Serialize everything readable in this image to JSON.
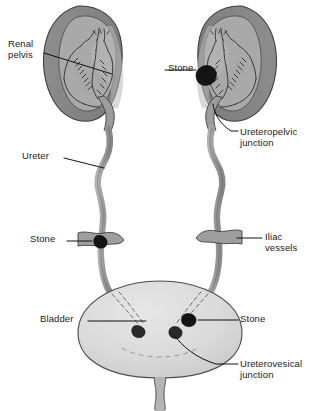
{
  "figure": {
    "type": "anatomical-diagram",
    "background_color": "#ffffff"
  },
  "colors": {
    "kidney_cortex": "#8a8a8a",
    "kidney_medulla": "#a8a8a8",
    "kidney_pelvis": "#9c9c9c",
    "ureter": "#9a9a9a",
    "bladder": "#d8d8d8",
    "stone": "#141414",
    "outline": "#3a3a3a",
    "leader_line": "#111111",
    "text": "#1a1a1a"
  },
  "labels": [
    {
      "id": "renal-pelvis",
      "line1": "Renal",
      "line2": "pelvis",
      "x": 8,
      "y": 38,
      "side": "left"
    },
    {
      "id": "stone-kidney",
      "line1": "Stone",
      "line2": "",
      "x": 168,
      "y": 66,
      "side": "left"
    },
    {
      "id": "ureteropelvic-junction",
      "line1": "Ureteropelvic",
      "line2": "junction",
      "x": 240,
      "y": 128,
      "side": "right"
    },
    {
      "id": "ureter",
      "line1": "Ureter",
      "line2": "",
      "x": 22,
      "y": 153,
      "side": "left"
    },
    {
      "id": "stone-ureter",
      "line1": "Stone",
      "line2": "",
      "x": 30,
      "y": 236,
      "side": "left"
    },
    {
      "id": "iliac-vessels",
      "line1": "Iliac",
      "line2": "vessels",
      "x": 265,
      "y": 234,
      "side": "right"
    },
    {
      "id": "bladder",
      "line1": "Bladder",
      "line2": "",
      "x": 40,
      "y": 316,
      "side": "left"
    },
    {
      "id": "stone-bladder",
      "line1": "Stone",
      "line2": "",
      "x": 240,
      "y": 316,
      "side": "right"
    },
    {
      "id": "ureterovesical-junction",
      "line1": "Ureterovesical",
      "line2": "junction",
      "x": 240,
      "y": 360,
      "side": "right"
    }
  ],
  "structures": {
    "left_kidney": "left-kidney-coronal-section",
    "right_kidney": "right-kidney-coronal-section",
    "left_ureter": "left-ureter",
    "right_ureter": "right-ureter",
    "bladder": "urinary-bladder",
    "urethra": "urethra",
    "iliac_vessel_left": "iliac-vessel-crossing-left",
    "iliac_vessel_right": "iliac-vessel-crossing-right"
  },
  "stones": [
    {
      "id": "stone-right-kidney-pelvis",
      "site": "renal pelvis / ureteropelvic junction",
      "cx": 207,
      "cy": 75,
      "rx": 9,
      "ry": 8
    },
    {
      "id": "stone-left-ureter-iliac",
      "site": "ureter at iliac vessel crossing",
      "cx": 101,
      "cy": 241,
      "rx": 5.5,
      "ry": 5
    },
    {
      "id": "stone-bladder-right-uvj",
      "site": "ureterovesical junction (right)",
      "cx": 190,
      "cy": 319,
      "rx": 5.5,
      "ry": 5
    },
    {
      "id": "stone-bladder-left-uvj",
      "site": "ureterovesical junction (left)",
      "cx": 177,
      "cy": 331,
      "rx": 5,
      "ry": 4.5
    },
    {
      "id": "stone-bladder-intramural",
      "site": "intramural ureter (left)",
      "cx": 141,
      "cy": 330,
      "rx": 5,
      "ry": 4
    }
  ],
  "caption": {
    "text": "",
    "visible": false
  }
}
